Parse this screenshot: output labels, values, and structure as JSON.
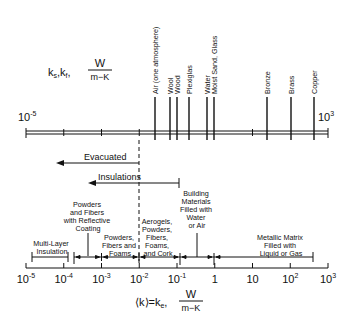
{
  "top_scale": {
    "symbol": "k",
    "sub1": "s",
    "sep": ",",
    "sub2": "f",
    "unit_num": "W",
    "unit_den": "m−K",
    "left_label": "10",
    "left_exp": "-5",
    "right_label": "10",
    "right_exp": "3",
    "materials": [
      {
        "name": "Air (one atmosphere)",
        "x": 155
      },
      {
        "name": "Wool",
        "x": 170
      },
      {
        "name": "Wood",
        "x": 177
      },
      {
        "name": "Plexiglas",
        "x": 189
      },
      {
        "name": "Water",
        "x": 207
      },
      {
        "name": "Moist Sand, Glass",
        "x": 214
      },
      {
        "name": "Bronze",
        "x": 267
      },
      {
        "name": "Brass",
        "x": 291
      },
      {
        "name": "Copper",
        "x": 314
      }
    ]
  },
  "arrows": {
    "evacuated": "Evacuated",
    "insulations": "Insulations"
  },
  "categories": [
    {
      "id": "multi-layer",
      "lines": [
        "Multi-Layer",
        "Insulation"
      ]
    },
    {
      "id": "powders-reflective",
      "lines": [
        "Powders",
        "and Fibers",
        "with Reflective",
        "Coating"
      ]
    },
    {
      "id": "powders-fibers-foams",
      "lines": [
        "Powders,",
        "Fibers and",
        "Foams"
      ]
    },
    {
      "id": "aerogels",
      "lines": [
        "Aerogels,",
        "Powders,",
        "Fibers,",
        "Foams,",
        "and Cork"
      ]
    },
    {
      "id": "building",
      "lines": [
        "Building",
        "Materials",
        "Filled with",
        "Water",
        "or Air"
      ]
    },
    {
      "id": "metallic",
      "lines": [
        "Metallic Matrix",
        "Filled with",
        "Liquid or Gas"
      ]
    }
  ],
  "bottom_scale": {
    "ticks": [
      {
        "base": "10",
        "exp": "-5"
      },
      {
        "base": "10",
        "exp": "-4"
      },
      {
        "base": "10",
        "exp": "-3"
      },
      {
        "base": "10",
        "exp": "-2"
      },
      {
        "base": "10",
        "exp": "-1"
      },
      {
        "base": "1",
        "exp": ""
      },
      {
        "base": "10",
        "exp": ""
      },
      {
        "base": "10",
        "exp": "2"
      },
      {
        "base": "10",
        "exp": "3"
      }
    ],
    "label_lhs": "⟨k⟩=k",
    "label_sub": "e",
    "label_sep": ",",
    "unit_num": "W",
    "unit_den": "m−K"
  }
}
